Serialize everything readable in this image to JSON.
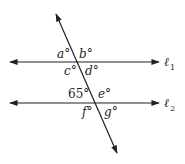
{
  "diagram": {
    "colors": {
      "stroke": "#231f20",
      "background": "#ffffff"
    },
    "lines": {
      "l1": {
        "label": "ℓ",
        "subscript": "1",
        "y": 62
      },
      "l2": {
        "label": "ℓ",
        "subscript": "2",
        "y": 103
      },
      "transversal": {
        "from": [
          55,
          12
        ],
        "to": [
          118,
          155
        ]
      }
    },
    "angles": {
      "a": "a°",
      "b": "b°",
      "c": "c°",
      "d": "d°",
      "given": "65°",
      "e": "e°",
      "f": "f°",
      "g": "g°"
    }
  }
}
